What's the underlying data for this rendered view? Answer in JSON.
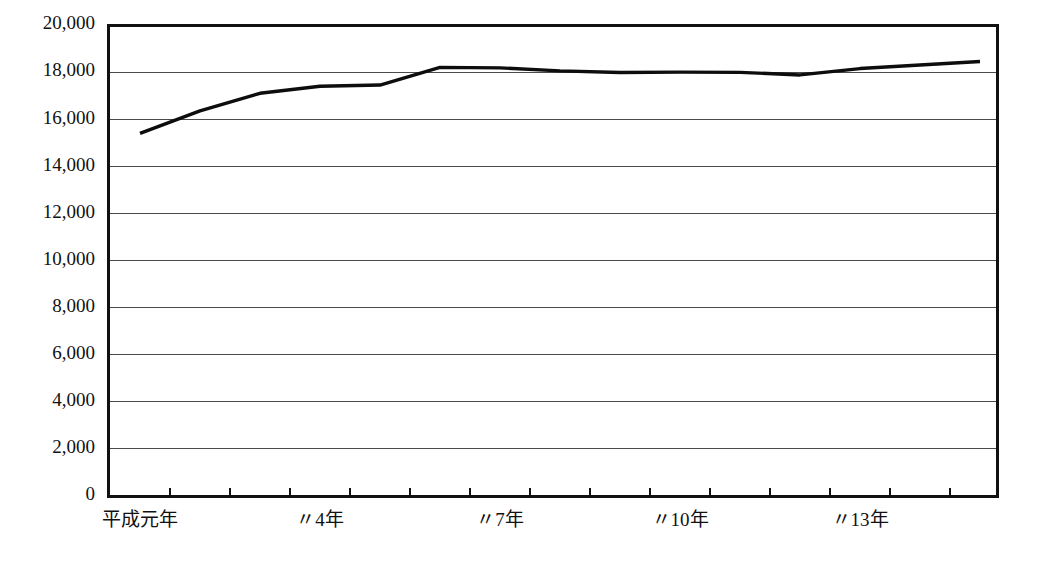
{
  "chart_data": {
    "type": "line",
    "title": "",
    "subtitle": "",
    "xlabel": "",
    "ylabel": "",
    "ylim": [
      0,
      20000
    ],
    "xlim": [
      1,
      15
    ],
    "grid": true,
    "legend": false,
    "y_ticks": [
      0,
      2000,
      4000,
      6000,
      8000,
      10000,
      12000,
      14000,
      16000,
      18000,
      20000
    ],
    "y_tick_labels": [
      "0",
      "2,000",
      "4,000",
      "6,000",
      "8,000",
      "10,000",
      "12,000",
      "14,000",
      "16,000",
      "18,000",
      "20,000"
    ],
    "x": [
      1,
      2,
      3,
      4,
      5,
      6,
      7,
      8,
      9,
      10,
      11,
      12,
      13,
      14,
      15
    ],
    "x_tick_labels": [
      "平成元年",
      "〃4年",
      "〃7年",
      "〃10年",
      "〃13年"
    ],
    "x_tick_label_years": [
      1,
      4,
      7,
      10,
      13
    ],
    "series": [
      {
        "name": "",
        "color": "#0d0d0d",
        "values": [
          15400,
          16350,
          17100,
          17400,
          17450,
          18200,
          18180,
          18050,
          17980,
          18000,
          17990,
          17880,
          18150,
          18300,
          18450
        ]
      }
    ]
  },
  "axes": {
    "frame_color": "#111111",
    "grid_color": "#4a4a4a",
    "background": "#ffffff"
  }
}
